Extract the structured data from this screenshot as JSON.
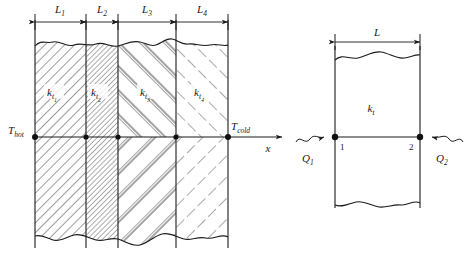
{
  "figure": {
    "background_color": "#ffffff",
    "line_color": "#1a1a1a",
    "hatch_color": "#555555"
  },
  "left_diagram": {
    "name": "four-layer-composite-wall",
    "dimension_labels": [
      {
        "base": "L",
        "sub": "1"
      },
      {
        "base": "L",
        "sub": "2"
      },
      {
        "base": "L",
        "sub": "3"
      },
      {
        "base": "L",
        "sub": "4"
      }
    ],
    "layers": [
      {
        "base": "k",
        "sub": "t",
        "subsub": "1",
        "hatch": "diagonal-right-medium"
      },
      {
        "base": "k",
        "sub": "t",
        "subsub": "2",
        "hatch": "diagonal-right-dense"
      },
      {
        "base": "k",
        "sub": "t",
        "subsub": "3",
        "hatch": "double-line-chevron"
      },
      {
        "base": "k",
        "sub": "t",
        "subsub": "4",
        "hatch": "dashed-chevron"
      }
    ],
    "temperature_left": {
      "base": "T",
      "sub": "hot"
    },
    "temperature_right": {
      "base": "T",
      "sub": "cold"
    },
    "axis_label": "x"
  },
  "right_diagram": {
    "name": "single-layer-element",
    "dimension_label": {
      "base": "L",
      "sub": ""
    },
    "conductivity": {
      "base": "k",
      "sub": "t"
    },
    "node_left": "1",
    "node_right": "2",
    "heat_left": {
      "base": "Q",
      "sub": "1"
    },
    "heat_right": {
      "base": "Q",
      "sub": "2"
    }
  }
}
